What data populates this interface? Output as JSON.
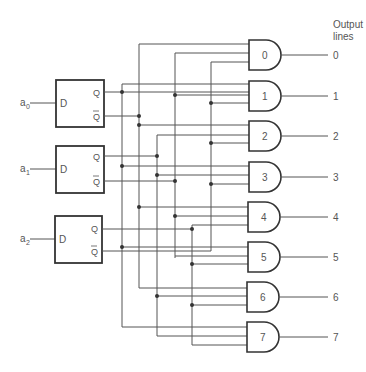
{
  "header": {
    "output_label_line1": "Output",
    "output_label_line2": "lines"
  },
  "flipflops": [
    {
      "input": "a0",
      "input_base": "a",
      "input_sub": "0",
      "d": "D",
      "q": "Q",
      "qbar": "Q"
    },
    {
      "input": "a1",
      "input_base": "a",
      "input_sub": "1",
      "d": "D",
      "q": "Q",
      "qbar": "Q"
    },
    {
      "input": "a2",
      "input_base": "a",
      "input_sub": "2",
      "d": "D",
      "q": "Q",
      "qbar": "Q"
    }
  ],
  "gates": [
    {
      "label": "0",
      "output": "0"
    },
    {
      "label": "1",
      "output": "1"
    },
    {
      "label": "2",
      "output": "2"
    },
    {
      "label": "3",
      "output": "3"
    },
    {
      "label": "4",
      "output": "4"
    },
    {
      "label": "5",
      "output": "5"
    },
    {
      "label": "6",
      "output": "6"
    },
    {
      "label": "7",
      "output": "7"
    }
  ]
}
